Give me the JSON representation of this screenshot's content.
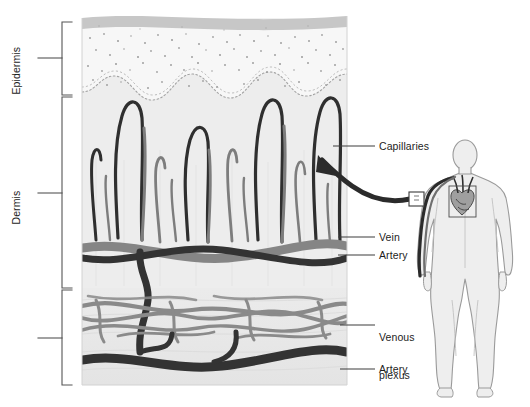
{
  "figure": {
    "type": "anatomical-diagram"
  },
  "layer_labels": [
    {
      "id": "epidermis",
      "text": "Epidermis",
      "orientation": "vertical"
    },
    {
      "id": "dermis",
      "text": "Dermis",
      "orientation": "vertical"
    },
    {
      "id": "subcutaneous",
      "text": "Subcutaneous\ntissue",
      "line1": "Subcutaneous",
      "line2": "tissue",
      "orientation": "vertical"
    }
  ],
  "callout_labels": [
    {
      "id": "capillaries",
      "text": "Capillaries"
    },
    {
      "id": "vein",
      "text": "Vein"
    },
    {
      "id": "artery-dermal",
      "text": "Artery"
    },
    {
      "id": "venous-plexus",
      "line1": "Venous",
      "line2": "plexus"
    },
    {
      "id": "artery-deep",
      "text": "Artery"
    }
  ],
  "colors": {
    "artery": "#2f2f2f",
    "vein": "#7d7d7d",
    "epidermis_fill": "#f2f2f2",
    "stratum_corneum": "#c9c9c9",
    "dermis_fill": "#ececec",
    "subcutaneous_fill": "#e8e8e8",
    "body_fill": "#eeeeee",
    "body_outline": "#9a9a9a",
    "leader_line": "#4a4a4a",
    "text": "#1d1d1d",
    "stipple": "#9d9d9d"
  },
  "body_figure": {
    "id": "human-body-silhouette",
    "callout_box": "forearm-sample-site",
    "organ": "heart"
  }
}
